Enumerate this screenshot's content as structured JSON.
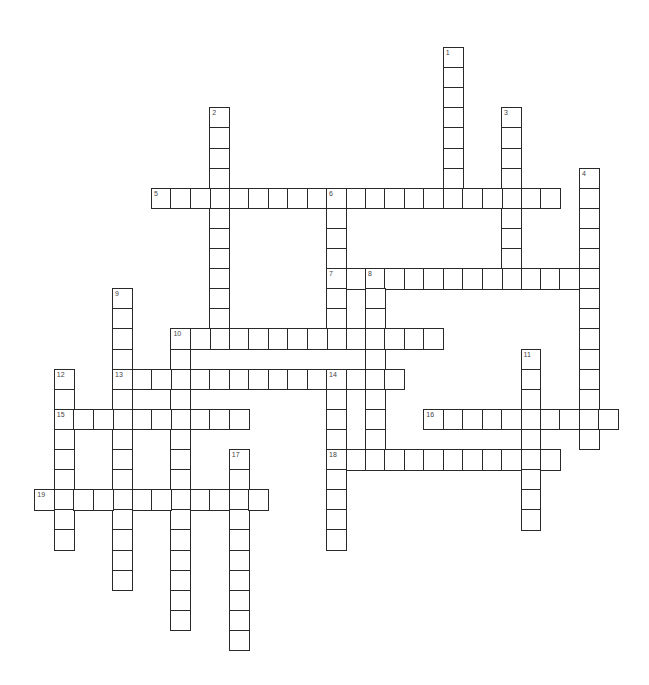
{
  "puzzle": {
    "type": "crossword",
    "grid": {
      "origin_x": 151,
      "origin_y": 47,
      "cell_w": 19.45,
      "cell_h": 20.1
    },
    "colors": {
      "border": "#2a2a2a",
      "cell_fill": "#ffffff",
      "number": "#444444",
      "background": "#ffffff"
    },
    "entries": [
      {
        "number": "1",
        "direction": "down",
        "row": 0,
        "col": 15,
        "length": 8
      },
      {
        "number": "2",
        "direction": "down",
        "row": 3,
        "col": 3,
        "length": 12
      },
      {
        "number": "3",
        "direction": "down",
        "row": 3,
        "col": 18,
        "length": 9
      },
      {
        "number": "4",
        "direction": "down",
        "row": 6,
        "col": 22,
        "length": 14
      },
      {
        "number": "5",
        "direction": "across",
        "row": 7,
        "col": 0,
        "length": 21
      },
      {
        "number": "6",
        "direction": "down",
        "row": 7,
        "col": 9,
        "length": 8
      },
      {
        "number": "7",
        "direction": "across",
        "row": 11,
        "col": 9,
        "length": 14
      },
      {
        "number": "8",
        "direction": "down",
        "row": 11,
        "col": 11,
        "length": 10
      },
      {
        "number": "9",
        "direction": "down",
        "row": 12,
        "col": -2,
        "length": 15
      },
      {
        "number": "10",
        "direction": "across",
        "row": 14,
        "col": 1,
        "length": 14
      },
      {
        "number": "10",
        "direction": "down",
        "row": 14,
        "col": 1,
        "length": 15
      },
      {
        "number": "11",
        "direction": "down",
        "row": 15,
        "col": 19,
        "length": 9
      },
      {
        "number": "12",
        "direction": "down",
        "row": 16,
        "col": -5,
        "length": 9
      },
      {
        "number": "13",
        "direction": "across",
        "row": 16,
        "col": -2,
        "length": 15
      },
      {
        "number": "14",
        "direction": "down",
        "row": 16,
        "col": 9,
        "length": 9
      },
      {
        "number": "15",
        "direction": "across",
        "row": 18,
        "col": -5,
        "length": 10
      },
      {
        "number": "16",
        "direction": "across",
        "row": 18,
        "col": 14,
        "length": 10
      },
      {
        "number": "17",
        "direction": "down",
        "row": 20,
        "col": 4,
        "length": 10
      },
      {
        "number": "18",
        "direction": "across",
        "row": 20,
        "col": 9,
        "length": 12
      },
      {
        "number": "19",
        "direction": "across",
        "row": 22,
        "col": -6,
        "length": 12
      }
    ]
  }
}
